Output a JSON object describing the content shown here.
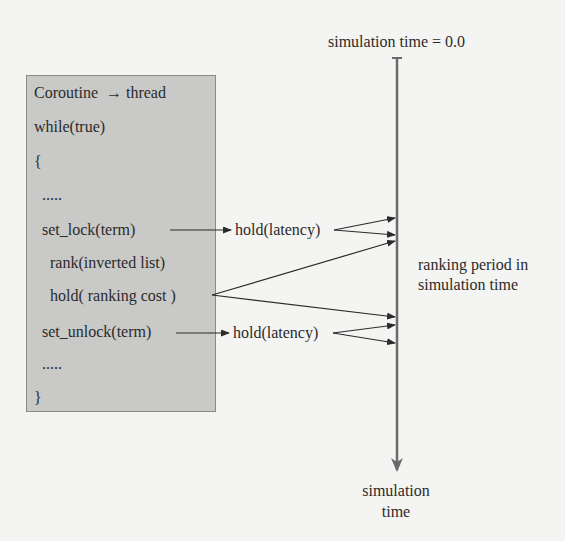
{
  "code_box": {
    "lines": [
      "Coroutine  → thread",
      "while(true)",
      "{",
      "  .....",
      "  set_lock(term)",
      "    rank(inverted list)",
      "    hold( ranking cost )",
      "  set_unlock(term)",
      "  .....",
      "}"
    ]
  },
  "labels": {
    "hold_latency_top": "hold(latency)",
    "hold_latency_bottom": "hold(latency)",
    "sim_time_start": "simulation time = 0.0",
    "ranking_period_line1": "ranking period in",
    "ranking_period_line2": "simulation time",
    "sim_time_end_line1": "simulation",
    "sim_time_end_line2": "time"
  },
  "colors": {
    "background": "#f4f4f2",
    "box_fill": "#c9c9c7",
    "box_border": "#8a8a88",
    "ink": "#2b2b2b",
    "timeline": "#6a6a6a"
  }
}
